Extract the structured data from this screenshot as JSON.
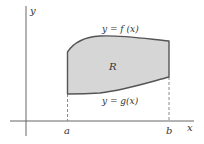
{
  "diagram": {
    "labels": {
      "y_axis": "y",
      "x_axis": "x",
      "top_curve": "y = f (x)",
      "bottom_curve": "y = g(x)",
      "region": "R",
      "left_bound": "a",
      "right_bound": "b"
    },
    "colors": {
      "region_fill": "#d6d6d6",
      "boundary_stroke": "#555555",
      "axis_stroke": "#666666",
      "dashed_stroke": "#8a8a8a",
      "text": "#333333"
    }
  }
}
